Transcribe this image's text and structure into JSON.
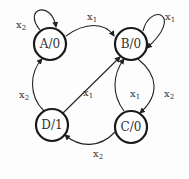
{
  "diagram": {
    "type": "state-machine",
    "nodes": [
      {
        "id": "A",
        "label": "A/0"
      },
      {
        "id": "B",
        "label": "B/0"
      },
      {
        "id": "C",
        "label": "C/0"
      },
      {
        "id": "D",
        "label": "D/1"
      }
    ],
    "edges": [
      {
        "from": "A",
        "to": "A",
        "var": "x",
        "sub": "2"
      },
      {
        "from": "B",
        "to": "B",
        "var": "x",
        "sub": "1"
      },
      {
        "from": "A",
        "to": "B",
        "var": "x",
        "sub": "1"
      },
      {
        "from": "D",
        "to": "A",
        "var": "x",
        "sub": "2"
      },
      {
        "from": "D",
        "to": "B",
        "var": "x",
        "sub": "1"
      },
      {
        "from": "C",
        "to": "B",
        "var": "x",
        "sub": "1"
      },
      {
        "from": "B",
        "to": "C",
        "var": "x",
        "sub": "2"
      },
      {
        "from": "C",
        "to": "D",
        "var": "x",
        "sub": "2"
      }
    ]
  }
}
